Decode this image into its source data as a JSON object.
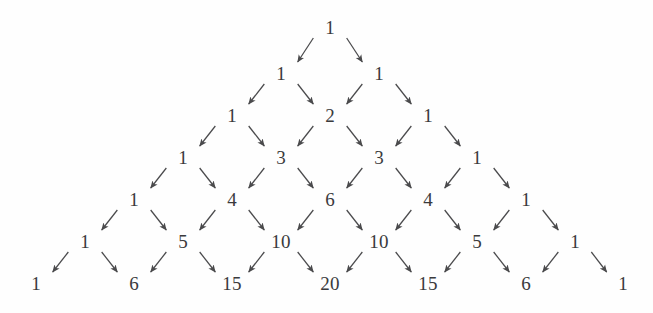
{
  "figure": {
    "kind": "pascals-triangle-with-arrows",
    "width": 653,
    "height": 313,
    "background_color": "#fefefe",
    "number_color": "#3a3a3c",
    "arrow_color": "#4a4a4c",
    "font_size_px": 19,
    "row_spacing_px": 42,
    "column_spacing_px": 98,
    "first_row_center_y": 27,
    "apex_center_x": 330
  },
  "chart_data": {
    "type": "diagram",
    "title": "",
    "xlabel": "",
    "ylabel": "",
    "rows": [
      {
        "index": 0,
        "y": 27,
        "values": [
          1
        ]
      },
      {
        "index": 1,
        "y": 73,
        "values": [
          1,
          1
        ]
      },
      {
        "index": 2,
        "y": 115,
        "values": [
          1,
          2,
          1
        ]
      },
      {
        "index": 3,
        "y": 157,
        "values": [
          1,
          3,
          3,
          1
        ]
      },
      {
        "index": 4,
        "y": 199,
        "values": [
          1,
          4,
          6,
          4,
          1
        ]
      },
      {
        "index": 5,
        "y": 241,
        "values": [
          1,
          5,
          10,
          10,
          5,
          1
        ]
      },
      {
        "index": 6,
        "y": 283,
        "values": [
          1,
          6,
          15,
          20,
          15,
          6,
          1
        ]
      }
    ],
    "nodes": [
      {
        "id": "n0-0",
        "row": 0,
        "col": 0,
        "label": "1",
        "x": 330,
        "y": 27
      },
      {
        "id": "n1-0",
        "row": 1,
        "col": 0,
        "label": "1",
        "x": 281,
        "y": 73
      },
      {
        "id": "n1-1",
        "row": 1,
        "col": 1,
        "label": "1",
        "x": 379,
        "y": 73
      },
      {
        "id": "n2-0",
        "row": 2,
        "col": 0,
        "label": "1",
        "x": 232,
        "y": 115
      },
      {
        "id": "n2-1",
        "row": 2,
        "col": 1,
        "label": "2",
        "x": 330,
        "y": 115
      },
      {
        "id": "n2-2",
        "row": 2,
        "col": 2,
        "label": "1",
        "x": 428,
        "y": 115
      },
      {
        "id": "n3-0",
        "row": 3,
        "col": 0,
        "label": "1",
        "x": 183,
        "y": 157
      },
      {
        "id": "n3-1",
        "row": 3,
        "col": 1,
        "label": "3",
        "x": 281,
        "y": 157
      },
      {
        "id": "n3-2",
        "row": 3,
        "col": 2,
        "label": "3",
        "x": 379,
        "y": 157
      },
      {
        "id": "n3-3",
        "row": 3,
        "col": 3,
        "label": "1",
        "x": 477,
        "y": 157
      },
      {
        "id": "n4-0",
        "row": 4,
        "col": 0,
        "label": "1",
        "x": 134,
        "y": 199
      },
      {
        "id": "n4-1",
        "row": 4,
        "col": 1,
        "label": "4",
        "x": 232,
        "y": 199
      },
      {
        "id": "n4-2",
        "row": 4,
        "col": 2,
        "label": "6",
        "x": 330,
        "y": 199
      },
      {
        "id": "n4-3",
        "row": 4,
        "col": 3,
        "label": "4",
        "x": 428,
        "y": 199
      },
      {
        "id": "n4-4",
        "row": 4,
        "col": 4,
        "label": "1",
        "x": 526,
        "y": 199
      },
      {
        "id": "n5-0",
        "row": 5,
        "col": 0,
        "label": "1",
        "x": 85,
        "y": 241
      },
      {
        "id": "n5-1",
        "row": 5,
        "col": 1,
        "label": "5",
        "x": 183,
        "y": 241
      },
      {
        "id": "n5-2",
        "row": 5,
        "col": 2,
        "label": "10",
        "x": 281,
        "y": 241
      },
      {
        "id": "n5-3",
        "row": 5,
        "col": 3,
        "label": "10",
        "x": 379,
        "y": 241
      },
      {
        "id": "n5-4",
        "row": 5,
        "col": 4,
        "label": "5",
        "x": 477,
        "y": 241
      },
      {
        "id": "n5-5",
        "row": 5,
        "col": 5,
        "label": "1",
        "x": 575,
        "y": 241
      },
      {
        "id": "n6-0",
        "row": 6,
        "col": 0,
        "label": "1",
        "x": 36,
        "y": 283
      },
      {
        "id": "n6-1",
        "row": 6,
        "col": 1,
        "label": "6",
        "x": 134,
        "y": 283
      },
      {
        "id": "n6-2",
        "row": 6,
        "col": 2,
        "label": "15",
        "x": 232,
        "y": 283
      },
      {
        "id": "n6-3",
        "row": 6,
        "col": 3,
        "label": "20",
        "x": 330,
        "y": 283
      },
      {
        "id": "n6-4",
        "row": 6,
        "col": 4,
        "label": "15",
        "x": 428,
        "y": 283
      },
      {
        "id": "n6-5",
        "row": 6,
        "col": 5,
        "label": "6",
        "x": 526,
        "y": 283
      },
      {
        "id": "n6-6",
        "row": 6,
        "col": 6,
        "label": "1",
        "x": 623,
        "y": 283
      }
    ],
    "edges": [
      {
        "from": "n0-0",
        "to": "n1-0",
        "direction": "down-left"
      },
      {
        "from": "n0-0",
        "to": "n1-1",
        "direction": "down-right"
      },
      {
        "from": "n1-0",
        "to": "n2-0",
        "direction": "down-left"
      },
      {
        "from": "n1-0",
        "to": "n2-1",
        "direction": "down-right"
      },
      {
        "from": "n1-1",
        "to": "n2-1",
        "direction": "down-left"
      },
      {
        "from": "n1-1",
        "to": "n2-2",
        "direction": "down-right"
      },
      {
        "from": "n2-0",
        "to": "n3-0",
        "direction": "down-left"
      },
      {
        "from": "n2-0",
        "to": "n3-1",
        "direction": "down-right"
      },
      {
        "from": "n2-1",
        "to": "n3-1",
        "direction": "down-left"
      },
      {
        "from": "n2-1",
        "to": "n3-2",
        "direction": "down-right"
      },
      {
        "from": "n2-2",
        "to": "n3-2",
        "direction": "down-left"
      },
      {
        "from": "n2-2",
        "to": "n3-3",
        "direction": "down-right"
      },
      {
        "from": "n3-0",
        "to": "n4-0",
        "direction": "down-left"
      },
      {
        "from": "n3-0",
        "to": "n4-1",
        "direction": "down-right"
      },
      {
        "from": "n3-1",
        "to": "n4-1",
        "direction": "down-left"
      },
      {
        "from": "n3-1",
        "to": "n4-2",
        "direction": "down-right"
      },
      {
        "from": "n3-2",
        "to": "n4-2",
        "direction": "down-left"
      },
      {
        "from": "n3-2",
        "to": "n4-3",
        "direction": "down-right"
      },
      {
        "from": "n3-3",
        "to": "n4-3",
        "direction": "down-left"
      },
      {
        "from": "n3-3",
        "to": "n4-4",
        "direction": "down-right"
      },
      {
        "from": "n4-0",
        "to": "n5-0",
        "direction": "down-left"
      },
      {
        "from": "n4-0",
        "to": "n5-1",
        "direction": "down-right"
      },
      {
        "from": "n4-1",
        "to": "n5-1",
        "direction": "down-left"
      },
      {
        "from": "n4-1",
        "to": "n5-2",
        "direction": "down-right"
      },
      {
        "from": "n4-2",
        "to": "n5-2",
        "direction": "down-left"
      },
      {
        "from": "n4-2",
        "to": "n5-3",
        "direction": "down-right"
      },
      {
        "from": "n4-3",
        "to": "n5-3",
        "direction": "down-left"
      },
      {
        "from": "n4-3",
        "to": "n5-4",
        "direction": "down-right"
      },
      {
        "from": "n4-4",
        "to": "n5-4",
        "direction": "down-left"
      },
      {
        "from": "n4-4",
        "to": "n5-5",
        "direction": "down-right"
      },
      {
        "from": "n5-0",
        "to": "n6-0",
        "direction": "down-left"
      },
      {
        "from": "n5-0",
        "to": "n6-1",
        "direction": "down-right"
      },
      {
        "from": "n5-1",
        "to": "n6-1",
        "direction": "down-left"
      },
      {
        "from": "n5-1",
        "to": "n6-2",
        "direction": "down-right"
      },
      {
        "from": "n5-2",
        "to": "n6-2",
        "direction": "down-left"
      },
      {
        "from": "n5-2",
        "to": "n6-3",
        "direction": "down-right"
      },
      {
        "from": "n5-3",
        "to": "n6-3",
        "direction": "down-left"
      },
      {
        "from": "n5-3",
        "to": "n6-4",
        "direction": "down-right"
      },
      {
        "from": "n5-4",
        "to": "n6-4",
        "direction": "down-left"
      },
      {
        "from": "n5-4",
        "to": "n6-5",
        "direction": "down-right"
      },
      {
        "from": "n5-5",
        "to": "n6-5",
        "direction": "down-left"
      },
      {
        "from": "n5-5",
        "to": "n6-6",
        "direction": "down-right"
      }
    ]
  }
}
